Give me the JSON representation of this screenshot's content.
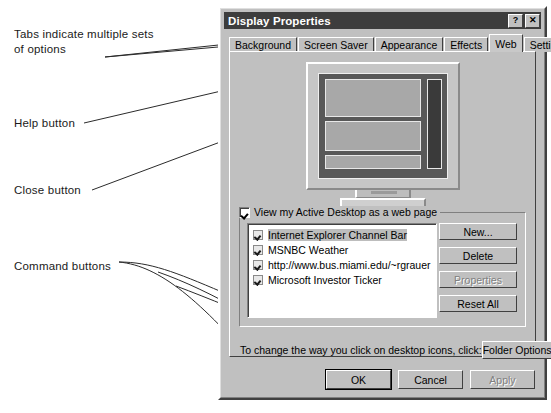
{
  "annotations": [
    {
      "id": "tabs",
      "text": "Tabs indicate multiple sets\nof options"
    },
    {
      "id": "help",
      "text": "Help button"
    },
    {
      "id": "close",
      "text": "Close button"
    },
    {
      "id": "command",
      "text": "Command buttons"
    }
  ],
  "dialog": {
    "title": "Display Properties",
    "titlebar_buttons": [
      {
        "name": "help-button",
        "glyph": "?"
      },
      {
        "name": "close-button",
        "glyph": "✕"
      }
    ],
    "tabs": [
      {
        "label": "Background",
        "selected": false
      },
      {
        "label": "Screen Saver",
        "selected": false
      },
      {
        "label": "Appearance",
        "selected": false
      },
      {
        "label": "Effects",
        "selected": false
      },
      {
        "label": "Web",
        "selected": true
      },
      {
        "label": "Settings",
        "selected": false
      }
    ],
    "preview": {
      "name": "monitor-preview"
    },
    "group": {
      "checkbox_label": "View my Active Desktop as a web page",
      "checkbox_checked": true,
      "items": [
        {
          "label": "Internet Explorer Channel Bar",
          "checked": true,
          "selected": true
        },
        {
          "label": "MSNBC Weather",
          "checked": true,
          "selected": false
        },
        {
          "label": "http://www.bus.miami.edu/~rgrauer",
          "checked": true,
          "selected": false
        },
        {
          "label": "Microsoft Investor Ticker",
          "checked": true,
          "selected": false
        }
      ],
      "buttons": [
        {
          "label": "New...",
          "disabled": false
        },
        {
          "label": "Delete",
          "disabled": false
        },
        {
          "label": "Properties",
          "disabled": true
        },
        {
          "label": "Reset All",
          "disabled": false
        }
      ]
    },
    "folder_row": {
      "text": "To change the way you click on desktop icons, click:",
      "button": "Folder Options"
    },
    "bottom_buttons": [
      {
        "label": "OK",
        "default": true,
        "disabled": false
      },
      {
        "label": "Cancel",
        "default": false,
        "disabled": false
      },
      {
        "label": "Apply",
        "default": false,
        "disabled": true
      }
    ]
  },
  "colors": {
    "face": "#c0c0c0",
    "titlebar": "#3d3d3d",
    "titlebar_text": "#ffffff",
    "selection": "#bdbdbd",
    "screen": "#585858",
    "disabled_text": "#808080"
  }
}
